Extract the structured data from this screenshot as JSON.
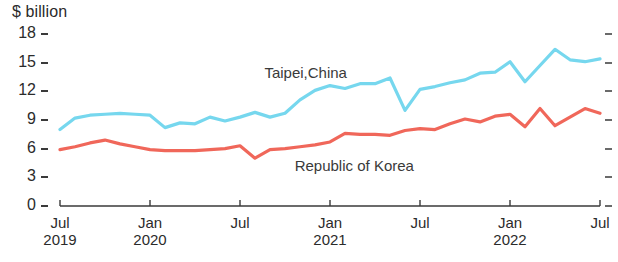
{
  "chart_data": {
    "type": "line",
    "title": "",
    "ylabel": "$ billion",
    "xlabel": "",
    "ylim": [
      0,
      18
    ],
    "y_ticks": [
      0,
      3,
      6,
      9,
      12,
      15,
      18
    ],
    "y_tick_labels": [
      "0",
      "3",
      "6",
      "9",
      "12",
      "15",
      "18"
    ],
    "grid": false,
    "legend_position": "inline-annotation",
    "x_tick_labels": [
      {
        "month": "Jul",
        "year": "2019"
      },
      {
        "month": "Jan",
        "year": "2020"
      },
      {
        "month": "Jul",
        "year": ""
      },
      {
        "month": "Jan",
        "year": "2021"
      },
      {
        "month": "Jul",
        "year": ""
      },
      {
        "month": "Jan",
        "year": "2022"
      },
      {
        "month": "Jul",
        "year": ""
      }
    ],
    "x": [
      "Jul 2019",
      "Aug 2019",
      "Sep 2019",
      "Oct 2019",
      "Nov 2019",
      "Dec 2019",
      "Jan 2020",
      "Feb 2020",
      "Mar 2020",
      "Apr 2020",
      "May 2020",
      "Jun 2020",
      "Jul 2020",
      "Aug 2020",
      "Sep 2020",
      "Oct 2020",
      "Nov 2020",
      "Dec 2020",
      "Jan 2021",
      "Feb 2021",
      "Mar 2021",
      "Apr 2021",
      "May 2021",
      "Jun 2021",
      "Jul 2021",
      "Aug 2021",
      "Sep 2021",
      "Oct 2021",
      "Nov 2021",
      "Dec 2021",
      "Jan 2022",
      "Feb 2022",
      "Mar 2022",
      "Apr 2022",
      "May 2022",
      "Jun 2022",
      "Jul 2022"
    ],
    "series": [
      {
        "name": "Taipei,China",
        "color": "#76d7ee",
        "label_x_frac": 0.455,
        "label_y_value": 13.9,
        "values": [
          8.0,
          9.2,
          9.5,
          9.6,
          9.7,
          9.6,
          9.5,
          8.2,
          8.7,
          8.6,
          9.3,
          8.9,
          9.3,
          9.8,
          9.3,
          9.7,
          11.1,
          12.1,
          12.6,
          12.3,
          12.8,
          12.8,
          13.4,
          10.0,
          12.2,
          12.5,
          12.9,
          13.2,
          13.9,
          14.0,
          15.1,
          13.0,
          14.7,
          16.4,
          15.3,
          15.1,
          15.4
        ]
      },
      {
        "name": "Republic of Korea",
        "color": "#f0675a",
        "label_x_frac": 0.545,
        "label_y_value": 4.2,
        "values": [
          5.9,
          6.2,
          6.6,
          6.9,
          6.5,
          6.2,
          5.9,
          5.8,
          5.8,
          5.8,
          5.9,
          6.0,
          6.3,
          5.0,
          5.9,
          6.0,
          6.2,
          6.4,
          6.7,
          7.6,
          7.5,
          7.5,
          7.4,
          7.9,
          8.1,
          8.0,
          8.6,
          9.1,
          8.8,
          9.4,
          9.6,
          8.3,
          10.2,
          8.4,
          9.3,
          10.2,
          9.7
        ]
      }
    ]
  },
  "axes": {
    "plot_left": 60,
    "plot_right": 600,
    "plot_top": 34,
    "plot_bottom": 206
  }
}
